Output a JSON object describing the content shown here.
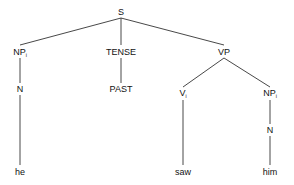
{
  "tree": {
    "nodes": [
      {
        "id": "s",
        "label": "S",
        "sub": ""
      },
      {
        "id": "np1",
        "label": "NP",
        "sub": "i"
      },
      {
        "id": "tense",
        "label": "TENSE",
        "sub": ""
      },
      {
        "id": "vp",
        "label": "VP",
        "sub": ""
      },
      {
        "id": "n1",
        "label": "N",
        "sub": ""
      },
      {
        "id": "past",
        "label": "PAST",
        "sub": ""
      },
      {
        "id": "v",
        "label": "V",
        "sub": "i"
      },
      {
        "id": "np2",
        "label": "NP",
        "sub": "i"
      },
      {
        "id": "n2",
        "label": "N",
        "sub": ""
      },
      {
        "id": "he",
        "label": "he",
        "sub": ""
      },
      {
        "id": "saw",
        "label": "saw",
        "sub": ""
      },
      {
        "id": "him",
        "label": "him",
        "sub": ""
      }
    ],
    "edges": [
      [
        "s",
        "np1"
      ],
      [
        "s",
        "tense"
      ],
      [
        "s",
        "vp"
      ],
      [
        "np1",
        "n1"
      ],
      [
        "tense",
        "past"
      ],
      [
        "vp",
        "v"
      ],
      [
        "vp",
        "np2"
      ],
      [
        "n1",
        "he"
      ],
      [
        "v",
        "saw"
      ],
      [
        "np2",
        "n2"
      ],
      [
        "n2",
        "him"
      ]
    ]
  }
}
